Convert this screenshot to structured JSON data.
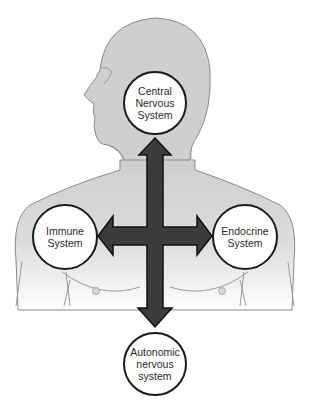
{
  "diagram": {
    "title": "",
    "colors": {
      "body_fill": "#cfcfcf",
      "body_fade": "#ffffff",
      "outline": "#8a8a8a",
      "arrow_fill": "#3c3c3c",
      "arrow_outline": "#111111",
      "node_fill": "#ffffff",
      "node_border": "#1a1a1a",
      "text": "#2a2a2a"
    },
    "nodes": [
      {
        "id": "cns",
        "lines": [
          "Central",
          "Nervous",
          "System"
        ]
      },
      {
        "id": "immune",
        "lines": [
          "Immune",
          "System"
        ]
      },
      {
        "id": "endocrine",
        "lines": [
          "Endocrine",
          "System"
        ]
      },
      {
        "id": "ans",
        "lines": [
          "Autonomic",
          "nervous",
          "system"
        ]
      }
    ],
    "connections": [
      {
        "from": "center",
        "to": "cns",
        "direction": "up"
      },
      {
        "from": "center",
        "to": "immune",
        "direction": "left"
      },
      {
        "from": "center",
        "to": "endocrine",
        "direction": "right"
      },
      {
        "from": "center",
        "to": "ans",
        "direction": "down"
      }
    ],
    "background_figure": "human head and upper torso silhouette"
  }
}
